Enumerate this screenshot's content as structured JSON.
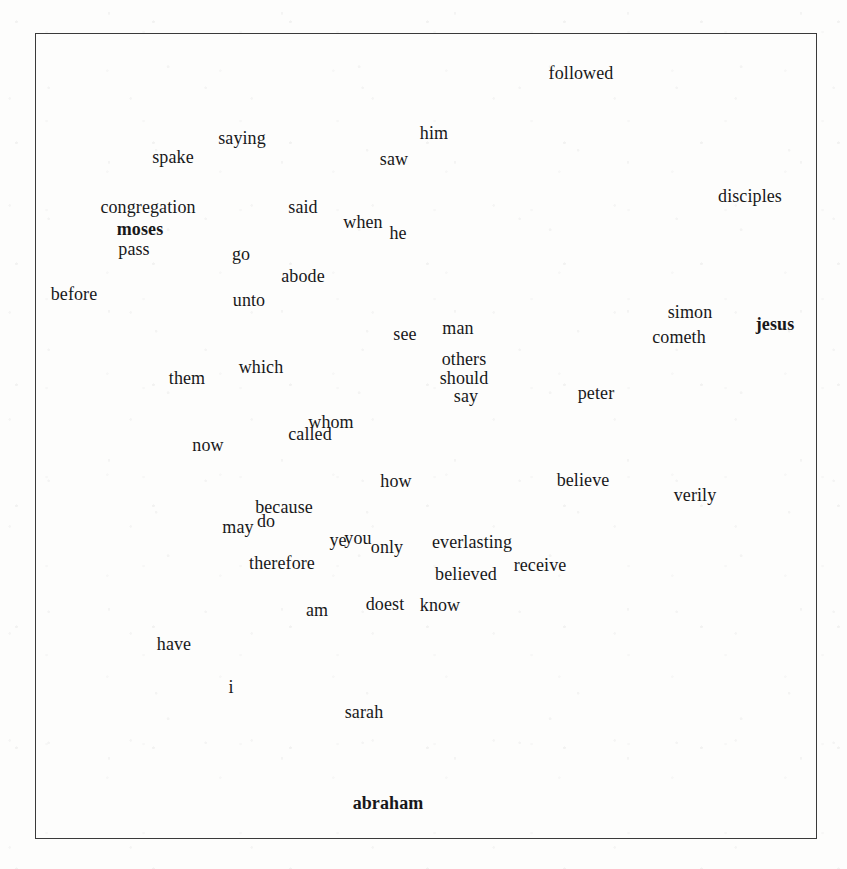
{
  "figure": {
    "type": "word-scatter-plot",
    "background_color": "#fdfdfc",
    "text_color": "#18181a",
    "frame_color": "#3a3a3a",
    "frame": {
      "x": 35,
      "y": 33,
      "width": 782,
      "height": 806
    },
    "axes": {
      "ticks_visible": false,
      "tick_labels_visible": false,
      "grid": false
    },
    "title": "",
    "xlabel": "",
    "ylabel": ""
  },
  "chart_data": {
    "type": "scatter",
    "title": "",
    "xlabel": "",
    "ylabel": "",
    "grid": false,
    "legend": "none",
    "point_labels_only": true,
    "note": "Each data point is rendered as its word label only; no marker glyphs are drawn.",
    "words": [
      {
        "text": "followed",
        "x": 581,
        "y": 73,
        "size": 18,
        "bold": false
      },
      {
        "text": "saying",
        "x": 242,
        "y": 138,
        "size": 18,
        "bold": false
      },
      {
        "text": "him",
        "x": 434,
        "y": 133,
        "size": 18,
        "bold": false
      },
      {
        "text": "spake",
        "x": 173,
        "y": 157,
        "size": 18,
        "bold": false
      },
      {
        "text": "saw",
        "x": 394,
        "y": 159,
        "size": 18,
        "bold": false
      },
      {
        "text": "disciples",
        "x": 750,
        "y": 196,
        "size": 18,
        "bold": false
      },
      {
        "text": "congregation",
        "x": 148,
        "y": 207,
        "size": 18,
        "bold": false
      },
      {
        "text": "said",
        "x": 303,
        "y": 207,
        "size": 18,
        "bold": false
      },
      {
        "text": "when",
        "x": 363,
        "y": 222,
        "size": 18,
        "bold": false
      },
      {
        "text": "moses",
        "x": 140,
        "y": 229,
        "size": 18,
        "bold": true
      },
      {
        "text": "he",
        "x": 398,
        "y": 233,
        "size": 18,
        "bold": false
      },
      {
        "text": "pass",
        "x": 134,
        "y": 249,
        "size": 18,
        "bold": false
      },
      {
        "text": "go",
        "x": 241,
        "y": 254,
        "size": 18,
        "bold": false
      },
      {
        "text": "abode",
        "x": 303,
        "y": 276,
        "size": 18,
        "bold": false
      },
      {
        "text": "before",
        "x": 74,
        "y": 294,
        "size": 18,
        "bold": false
      },
      {
        "text": "unto",
        "x": 249,
        "y": 300,
        "size": 18,
        "bold": false
      },
      {
        "text": "simon",
        "x": 690,
        "y": 312,
        "size": 18,
        "bold": false
      },
      {
        "text": "see",
        "x": 405,
        "y": 334,
        "size": 18,
        "bold": false
      },
      {
        "text": "man",
        "x": 458,
        "y": 328,
        "size": 18,
        "bold": false
      },
      {
        "text": "jesus",
        "x": 775,
        "y": 324,
        "size": 18,
        "bold": true
      },
      {
        "text": "cometh",
        "x": 679,
        "y": 337,
        "size": 18,
        "bold": false
      },
      {
        "text": "others",
        "x": 464,
        "y": 359,
        "size": 18,
        "bold": false
      },
      {
        "text": "which",
        "x": 261,
        "y": 367,
        "size": 18,
        "bold": false
      },
      {
        "text": "should",
        "x": 464,
        "y": 378,
        "size": 18,
        "bold": false
      },
      {
        "text": "them",
        "x": 187,
        "y": 378,
        "size": 18,
        "bold": false
      },
      {
        "text": "peter",
        "x": 596,
        "y": 393,
        "size": 18,
        "bold": false
      },
      {
        "text": "say",
        "x": 466,
        "y": 396,
        "size": 18,
        "bold": false
      },
      {
        "text": "whom",
        "x": 331,
        "y": 422,
        "size": 18,
        "bold": false
      },
      {
        "text": "called",
        "x": 310,
        "y": 434,
        "size": 18,
        "bold": false
      },
      {
        "text": "now",
        "x": 208,
        "y": 445,
        "size": 18,
        "bold": false
      },
      {
        "text": "how",
        "x": 396,
        "y": 481,
        "size": 18,
        "bold": false
      },
      {
        "text": "believe",
        "x": 583,
        "y": 480,
        "size": 18,
        "bold": false
      },
      {
        "text": "verily",
        "x": 695,
        "y": 495,
        "size": 18,
        "bold": false
      },
      {
        "text": "because",
        "x": 284,
        "y": 507,
        "size": 18,
        "bold": false
      },
      {
        "text": "do",
        "x": 266,
        "y": 521,
        "size": 18,
        "bold": false
      },
      {
        "text": "may",
        "x": 238,
        "y": 527,
        "size": 18,
        "bold": false
      },
      {
        "text": "ye",
        "x": 338,
        "y": 540,
        "size": 18,
        "bold": false
      },
      {
        "text": "you",
        "x": 358,
        "y": 538,
        "size": 18,
        "bold": false
      },
      {
        "text": "only",
        "x": 387,
        "y": 547,
        "size": 18,
        "bold": false
      },
      {
        "text": "everlasting",
        "x": 472,
        "y": 542,
        "size": 18,
        "bold": false
      },
      {
        "text": "therefore",
        "x": 282,
        "y": 563,
        "size": 18,
        "bold": false
      },
      {
        "text": "believed",
        "x": 466,
        "y": 574,
        "size": 18,
        "bold": false
      },
      {
        "text": "receive",
        "x": 540,
        "y": 565,
        "size": 18,
        "bold": false
      },
      {
        "text": "doest",
        "x": 385,
        "y": 604,
        "size": 18,
        "bold": false
      },
      {
        "text": "know",
        "x": 440,
        "y": 605,
        "size": 18,
        "bold": false
      },
      {
        "text": "am",
        "x": 317,
        "y": 610,
        "size": 18,
        "bold": false
      },
      {
        "text": "have",
        "x": 174,
        "y": 644,
        "size": 18,
        "bold": false
      },
      {
        "text": "i",
        "x": 231,
        "y": 687,
        "size": 18,
        "bold": false
      },
      {
        "text": "sarah",
        "x": 364,
        "y": 712,
        "size": 18,
        "bold": false
      },
      {
        "text": "abraham",
        "x": 388,
        "y": 803,
        "size": 18,
        "bold": true
      }
    ]
  }
}
